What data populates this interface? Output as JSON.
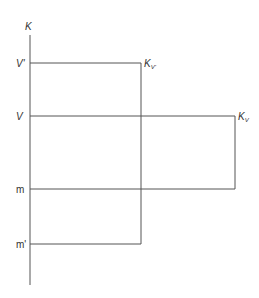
{
  "diagram": {
    "axis_label": "K",
    "levels": [
      {
        "id": "v-prime",
        "label": "V'",
        "y": 63,
        "end_x": 141,
        "end_label_main": "K",
        "end_label_sub": "V'"
      },
      {
        "id": "v",
        "label": "V",
        "y": 116,
        "end_x": 235,
        "end_label_main": "K",
        "end_label_sub": "V"
      },
      {
        "id": "m",
        "label": "m",
        "y": 189,
        "end_x": 235
      },
      {
        "id": "m-prime",
        "label": "m'",
        "y": 244,
        "end_x": 141
      }
    ],
    "connectors": [
      {
        "id": "k-v-prime-connector",
        "x": 141,
        "from_y": 63,
        "to_y": 244
      },
      {
        "id": "k-v-connector",
        "x": 235,
        "from_y": 116,
        "to_y": 189
      }
    ],
    "line_color": "#555555",
    "text_color": "#333333"
  }
}
